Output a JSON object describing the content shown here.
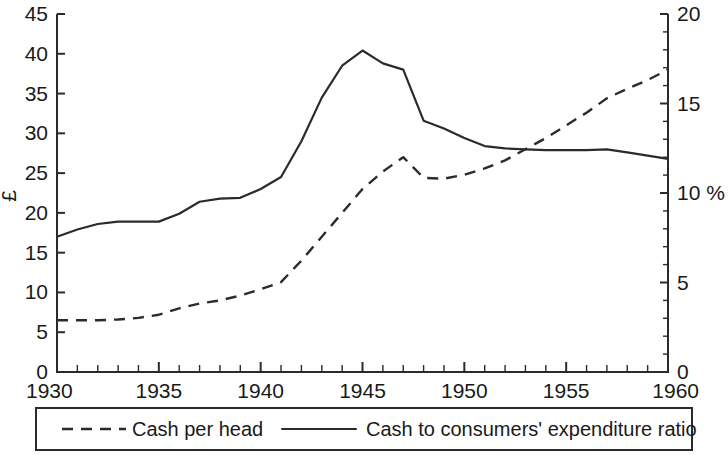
{
  "chart_data": {
    "type": "line",
    "title": "",
    "xlabel": "",
    "ylabel": "£",
    "y2label": "%",
    "xlim": [
      1930,
      1960
    ],
    "ylim": [
      0,
      45
    ],
    "y2lim": [
      0,
      20
    ],
    "x_ticks": [
      1930,
      1935,
      1940,
      1945,
      1950,
      1955,
      1960
    ],
    "x_tick_labels": [
      "1930",
      "1935",
      "1940",
      "1945",
      "1950",
      "1955",
      "1960"
    ],
    "x_minor_step": 1,
    "y_ticks": [
      0,
      5,
      10,
      15,
      20,
      25,
      30,
      35,
      40,
      45
    ],
    "y_tick_labels": [
      "0",
      "5",
      "10",
      "15",
      "20",
      "25",
      "30",
      "35",
      "40",
      "45"
    ],
    "y2_ticks": [
      0,
      5,
      10,
      15,
      20
    ],
    "y2_tick_labels": [
      "0",
      "5",
      "10 %",
      "15",
      "20"
    ],
    "y2_minor_step": 1,
    "grid": false,
    "legend_position": "bottom",
    "series": [
      {
        "name": "Cash per head",
        "style": "dashed",
        "axis": "left",
        "color": "#2b2b2b",
        "x": [
          1930,
          1931,
          1932,
          1933,
          1934,
          1935,
          1936,
          1937,
          1938,
          1939,
          1940,
          1941,
          1942,
          1943,
          1944,
          1945,
          1946,
          1947,
          1948,
          1949,
          1950,
          1951,
          1952,
          1953,
          1954,
          1955,
          1956,
          1957,
          1958,
          1959,
          1960
        ],
        "values": [
          6.5,
          6.5,
          6.5,
          6.6,
          6.8,
          7.2,
          8.0,
          8.6,
          9.0,
          9.6,
          10.4,
          11.3,
          14.0,
          17.0,
          20.0,
          23.0,
          25.2,
          27.0,
          24.4,
          24.3,
          24.8,
          25.6,
          26.6,
          28.0,
          29.4,
          31.0,
          32.6,
          34.4,
          35.6,
          36.7,
          38.0
        ]
      },
      {
        "name": "Cash to consumers' expenditure ratio",
        "style": "solid",
        "axis": "right",
        "color": "#2b2b2b",
        "x": [
          1930,
          1931,
          1932,
          1933,
          1934,
          1935,
          1936,
          1937,
          1938,
          1939,
          1940,
          1941,
          1942,
          1943,
          1944,
          1945,
          1946,
          1947,
          1948,
          1949,
          1950,
          1951,
          1952,
          1953,
          1954,
          1955,
          1956,
          1957,
          1958,
          1959,
          1960
        ],
        "values_left_scale": [
          17.0,
          17.9,
          18.6,
          18.9,
          18.9,
          18.9,
          19.9,
          21.4,
          21.8,
          21.9,
          23.0,
          24.5,
          29.0,
          34.5,
          38.5,
          40.4,
          38.8,
          38.0,
          31.6,
          30.6,
          29.4,
          28.4,
          28.1,
          28.0,
          27.9,
          27.9,
          27.9,
          28.0,
          27.6,
          27.2,
          26.8
        ],
        "values": [
          7.56,
          7.96,
          8.27,
          8.4,
          8.4,
          8.4,
          8.84,
          9.51,
          9.69,
          9.73,
          10.22,
          10.89,
          12.89,
          15.33,
          17.11,
          17.96,
          17.24,
          16.89,
          14.04,
          13.6,
          13.07,
          12.62,
          12.49,
          12.44,
          12.4,
          12.4,
          12.4,
          12.44,
          12.27,
          12.09,
          11.91
        ]
      }
    ]
  },
  "legend": {
    "items": [
      {
        "label": "Cash per head",
        "style": "dashed"
      },
      {
        "label": "Cash to consumers' expenditure ratio",
        "style": "solid"
      }
    ]
  }
}
